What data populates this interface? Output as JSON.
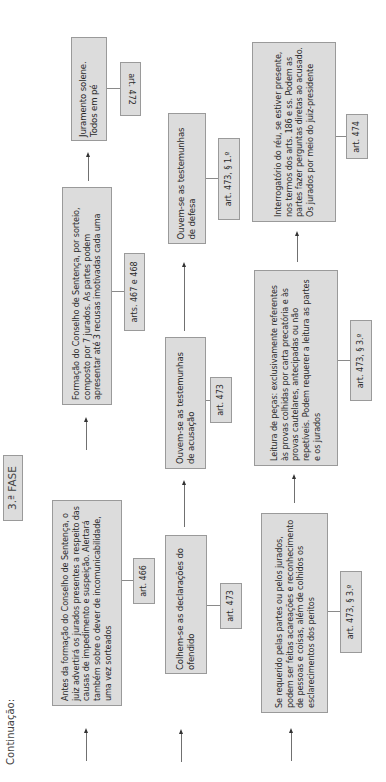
{
  "header": {
    "continuation_label": "Continuação:",
    "phase_label": "3.ª FASE"
  },
  "colors": {
    "box_fill": "#dcdcdc",
    "box_border": "#9a9a9a",
    "text": "#2a2a2a",
    "connector": "#707070"
  },
  "columns": [
    {
      "steps": [
        {
          "text": "Antes da formação do Conselho de Sentença, o juiz advertirá os jurados presentes a respeito das causas de impedimento e suspeição. Alertará também sobre o dever de incomunicabilidade, uma vez sorteados",
          "ref": "art. 466"
        },
        {
          "text": "Formação do Conselho de Sentença, por sorteio, composto por 7 jurados. As partes podem apresentar até 3 recusas imotivadas cada uma",
          "ref": "arts. 467 e 468"
        },
        {
          "text": "Juramento solene. Todos em pé",
          "ref": "art. 472"
        }
      ]
    },
    {
      "steps": [
        {
          "text": "Colhem-se as declarações do ofendido",
          "ref": "art. 473"
        },
        {
          "text": "Ouvem-se as testemunhas de acusação",
          "ref": "art. 473"
        },
        {
          "text": "Ouvem-se as testemunhas de defesa",
          "ref": "art. 473, § 1.º"
        }
      ]
    },
    {
      "steps": [
        {
          "text": "Se requerido pelas partes ou pelos jurados, podem ser feitas acareações e reconhecimento de pessoas e coisas, além de colhidos os esclarecimentos dos peritos",
          "ref": "art. 473, § 3.º"
        },
        {
          "text": "Leitura de peças: exclusivamente referentes às provas colhidas por carta precatória e às provas cautelares, antecipadas ou não repetíveis. Podem requerer a leitura as partes e os jurados",
          "ref": "art. 473, § 3.º"
        },
        {
          "text": "Interrogatório do réu, se estiver presente, nos termos dos arts. 186 e ss. Podem as partes fazer perguntas diretas ao acusado. Os jurados por meio do juiz-presidente",
          "ref": "art. 474"
        }
      ]
    }
  ]
}
